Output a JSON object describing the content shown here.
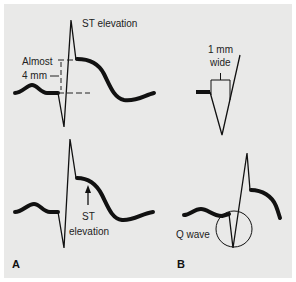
{
  "figure": {
    "background": "#e9e9e8",
    "line_color": "#111111",
    "panels": [
      {
        "id": "A",
        "label": "A",
        "top_ecg": {
          "title": "ST elevation",
          "measure_label_line1": "Almost",
          "measure_label_line2": "4 mm"
        },
        "bottom_ecg": {
          "arrow_label_line1": "ST",
          "arrow_label_line2": "elevation"
        }
      },
      {
        "id": "B",
        "label": "B",
        "top_ecg": {
          "width_label_line1": "1 mm",
          "width_label_line2": "wide"
        },
        "bottom_ecg": {
          "circle_label": "Q wave"
        }
      }
    ]
  }
}
